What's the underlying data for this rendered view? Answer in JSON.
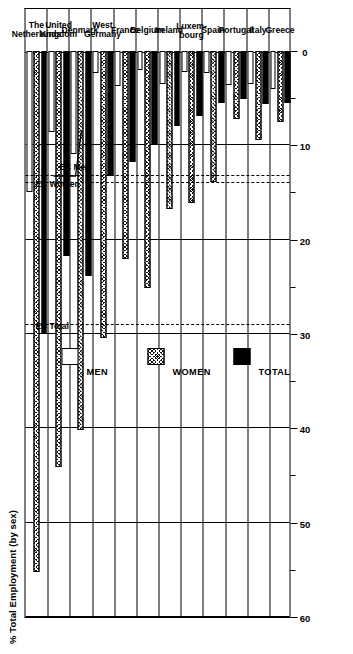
{
  "chart_data": {
    "type": "bar",
    "title": "% Total Employment (by sex)",
    "orientation": "horizontal",
    "xlabel": "% Total Employment (by sex)",
    "ylabel": "",
    "xlim": [
      0,
      60
    ],
    "xticks": [
      0,
      10,
      20,
      30,
      40,
      50,
      60
    ],
    "xticklabels": [
      "0",
      "10",
      "20",
      "30",
      "40",
      "50",
      "60"
    ],
    "minor_xticks": [
      5,
      15,
      25,
      35,
      45,
      55
    ],
    "grid": true,
    "legend_position": "upper-left-inside",
    "categories": [
      "The Netherlands",
      "United Kingdom",
      "Denmark",
      "West Germany",
      "France",
      "Belgium",
      "Ireland",
      "Luxembourg",
      "Spain",
      "Portugal",
      "Italy",
      "Greece"
    ],
    "category_labels": [
      "The\nNetherlands",
      "United\nKingdom",
      "Denmark",
      "West\nGermany",
      "France",
      "Belgium",
      "Ireland",
      "Luxem-\nbourg",
      "Spain",
      "Portugal",
      "Italy",
      "Greece"
    ],
    "series": [
      {
        "name": "MEN",
        "key": "men",
        "style": "open",
        "values": [
          15.0,
          8.6,
          10.9,
          2.3,
          3.7,
          2.0,
          3.5,
          2.2,
          2.3,
          3.6,
          3.5,
          4.0
        ]
      },
      {
        "name": "WOMEN",
        "key": "women",
        "style": "hatched",
        "values": [
          55.2,
          44.1,
          40.2,
          30.4,
          22.0,
          25.1,
          16.8,
          16.1,
          13.9,
          7.2,
          9.4,
          7.5
        ]
      },
      {
        "name": "TOTAL",
        "key": "total",
        "style": "solid",
        "values": [
          30.0,
          21.7,
          23.8,
          13.2,
          11.8,
          9.9,
          7.9,
          6.9,
          5.5,
          5.1,
          5.6,
          5.5
        ]
      }
    ],
    "reference_lines": [
      {
        "label": "EC Total",
        "value": 29.0
      },
      {
        "label": "EC Women",
        "value": 14.0
      },
      {
        "label": "EC Men",
        "value": 13.3
      }
    ],
    "legend": [
      {
        "label": "MEN",
        "key": "men"
      },
      {
        "label": "WOMEN",
        "key": "women"
      },
      {
        "label": "TOTAL",
        "key": "total"
      }
    ]
  }
}
